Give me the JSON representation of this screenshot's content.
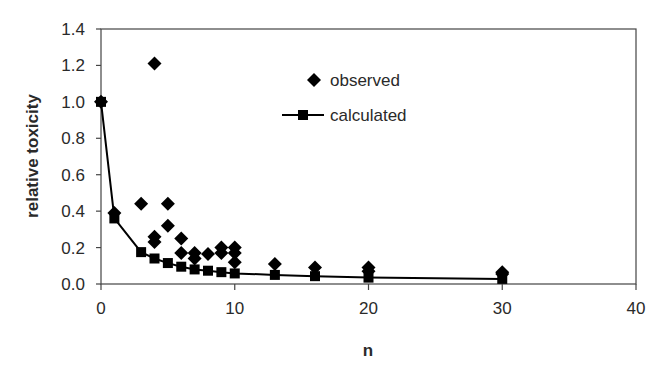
{
  "chart_data": {
    "type": "scatter",
    "title": "",
    "xlabel": "n",
    "ylabel": "relative toxicity",
    "xlim": [
      0,
      40
    ],
    "ylim": [
      0,
      1.4
    ],
    "xticks": [
      0,
      10,
      20,
      30,
      40
    ],
    "xtick_labels": [
      "0",
      "10",
      "20",
      "30",
      "40"
    ],
    "yticks": [
      0.0,
      0.2,
      0.4,
      0.6,
      0.8,
      1.0,
      1.2,
      1.4
    ],
    "ytick_labels": [
      "0.0",
      "0.2",
      "0.4",
      "0.6",
      "0.8",
      "1.0",
      "1.2",
      "1.4"
    ],
    "grid": false,
    "legend_position": "upper center (inside plot)",
    "series": [
      {
        "name": "observed",
        "style": "scatter",
        "marker": "diamond",
        "color": "#000000",
        "points": [
          [
            0,
            1.0
          ],
          [
            1,
            0.39
          ],
          [
            3,
            0.44
          ],
          [
            4,
            1.21
          ],
          [
            4,
            0.26
          ],
          [
            4,
            0.23
          ],
          [
            5,
            0.44
          ],
          [
            5,
            0.32
          ],
          [
            6,
            0.25
          ],
          [
            6,
            0.17
          ],
          [
            7,
            0.17
          ],
          [
            7,
            0.14
          ],
          [
            8,
            0.165
          ],
          [
            9,
            0.2
          ],
          [
            9,
            0.17
          ],
          [
            10,
            0.2
          ],
          [
            10,
            0.17
          ],
          [
            10,
            0.12
          ],
          [
            13,
            0.11
          ],
          [
            16,
            0.09
          ],
          [
            20,
            0.09
          ],
          [
            20,
            0.07
          ],
          [
            30,
            0.065
          ],
          [
            30,
            0.055
          ]
        ]
      },
      {
        "name": "calculated",
        "style": "line+marker",
        "marker": "square",
        "color": "#000000",
        "points": [
          [
            0,
            1.0
          ],
          [
            1,
            0.36
          ],
          [
            3,
            0.175
          ],
          [
            4,
            0.14
          ],
          [
            5,
            0.115
          ],
          [
            6,
            0.095
          ],
          [
            7,
            0.08
          ],
          [
            8,
            0.073
          ],
          [
            9,
            0.065
          ],
          [
            10,
            0.058
          ],
          [
            13,
            0.05
          ],
          [
            16,
            0.043
          ],
          [
            20,
            0.035
          ],
          [
            30,
            0.028
          ]
        ]
      }
    ]
  },
  "legend": {
    "items": [
      {
        "label": "observed",
        "marker": "diamond"
      },
      {
        "label": "calculated",
        "marker": "square-line"
      }
    ]
  },
  "colors": {
    "ink": "#000000",
    "axis": "#3a3a3a",
    "text": "#2a2a2a",
    "background": "#ffffff"
  }
}
